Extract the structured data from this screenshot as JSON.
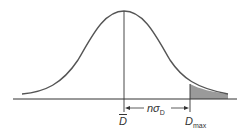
{
  "figure": {
    "type": "normal-distribution-diagram",
    "colors": {
      "curve": "#555555",
      "axis": "#333333",
      "shade": "#9a9a9a"
    },
    "labels": {
      "mean": "D",
      "max_main": "D",
      "max_sub": "max",
      "interval_main": "nσ",
      "interval_sub": "D"
    }
  }
}
